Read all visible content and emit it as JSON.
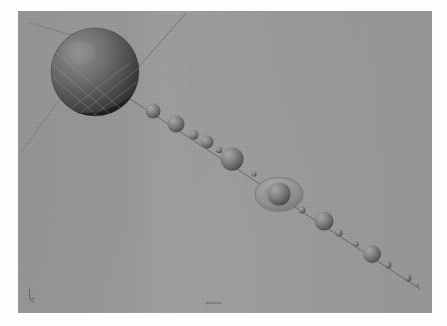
{
  "figure": {
    "medium": "grayscale 3d raytraced scene",
    "background_color": "#9a9a9a",
    "paper_color": "#fdfdfd",
    "canvas": {
      "x": 18,
      "y": 11,
      "width": 414,
      "height": 302
    }
  },
  "captions": {
    "bottom_left": "fig.",
    "bottom_center": "planetary"
  },
  "scene": {
    "grid": {
      "visible": true,
      "style": "diamond lattice",
      "color": "#8e8e8e",
      "fades_toward": "lower-right"
    },
    "orbit_line": {
      "visible": true,
      "color": "#5a5a5a",
      "from": [
        96,
        84
      ],
      "to": [
        400,
        276
      ]
    },
    "axis_lines": [
      {
        "name": "axis-upper-right",
        "x1": 96,
        "y1": 84,
        "x2": 168,
        "y2": 2
      },
      {
        "name": "axis-upper-left",
        "x1": 96,
        "y1": 84,
        "x2": 14,
        "y2": 14
      },
      {
        "name": "axis-lower-left",
        "x1": 96,
        "y1": 84,
        "x2": 8,
        "y2": 142
      }
    ],
    "bodies": [
      {
        "id": "primary",
        "label": "primary sphere",
        "cx": 77,
        "cy": 61,
        "r": 44,
        "shade": "dark",
        "ringed": false
      },
      {
        "id": "body-1",
        "label": "body 1",
        "cx": 135,
        "cy": 100,
        "r": 7.5,
        "shade": "mid",
        "ringed": false
      },
      {
        "id": "body-2",
        "label": "body 2",
        "cx": 158,
        "cy": 113,
        "r": 8.5,
        "shade": "mid",
        "ringed": false
      },
      {
        "id": "body-3",
        "label": "body 3",
        "cx": 176,
        "cy": 124,
        "r": 4.5,
        "shade": "mid",
        "ringed": false
      },
      {
        "id": "body-4",
        "label": "body 4",
        "cx": 189,
        "cy": 131,
        "r": 6.5,
        "shade": "mid",
        "ringed": false
      },
      {
        "id": "body-5",
        "label": "body 5",
        "cx": 201,
        "cy": 139,
        "r": 3.2,
        "shade": "mid",
        "ringed": false
      },
      {
        "id": "body-6",
        "label": "body 6",
        "cx": 214,
        "cy": 148,
        "r": 11.5,
        "shade": "mid",
        "ringed": false
      },
      {
        "id": "body-7",
        "label": "body 7",
        "cx": 236,
        "cy": 163,
        "r": 2.6,
        "shade": "mid",
        "ringed": false
      },
      {
        "id": "ringed",
        "label": "ringed body",
        "cx": 261,
        "cy": 183,
        "r": 11.5,
        "ring_rx": 24,
        "ring_ry": 17,
        "shade": "mid",
        "ringed": true
      },
      {
        "id": "body-9",
        "label": "body 9",
        "cx": 284,
        "cy": 199,
        "r": 3.4,
        "shade": "mid",
        "ringed": false
      },
      {
        "id": "body-10",
        "label": "body 10",
        "cx": 306,
        "cy": 210,
        "r": 9.5,
        "shade": "mid",
        "ringed": false
      },
      {
        "id": "body-11",
        "label": "body 11",
        "cx": 321,
        "cy": 222,
        "r": 3.6,
        "shade": "mid",
        "ringed": false
      },
      {
        "id": "body-12",
        "label": "body 12",
        "cx": 338,
        "cy": 233,
        "r": 2.6,
        "shade": "mid",
        "ringed": false
      },
      {
        "id": "body-13",
        "label": "body 13",
        "cx": 354,
        "cy": 243,
        "r": 9.0,
        "shade": "mid",
        "ringed": false
      },
      {
        "id": "body-14",
        "label": "body 14",
        "cx": 370,
        "cy": 254,
        "r": 3.4,
        "shade": "mid",
        "ringed": false
      },
      {
        "id": "body-15",
        "label": "body 15",
        "cx": 390,
        "cy": 267,
        "r": 3.4,
        "shade": "mid",
        "ringed": false
      },
      {
        "id": "body-16",
        "label": "body 16",
        "cx": 399,
        "cy": 274,
        "r": 1.6,
        "shade": "mid",
        "ringed": false
      }
    ]
  }
}
